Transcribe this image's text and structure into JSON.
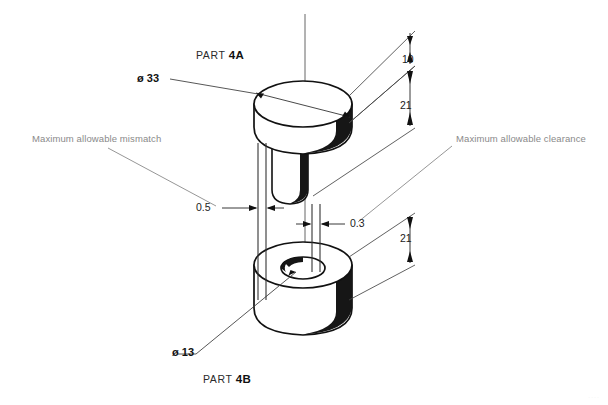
{
  "drawing": {
    "title_parts": [
      {
        "prefix": "PART",
        "id": "4A"
      },
      {
        "prefix": "PART",
        "id": "4B"
      }
    ],
    "part_top_label_prefix": "PART",
    "part_top_label_id": "4A",
    "part_bottom_label_prefix": "PART",
    "part_bottom_label_id": "4B",
    "diameters": {
      "head": "ø 33",
      "bore": "ø 13"
    },
    "dimensions": {
      "top_flange_height": "10",
      "top_part_height": "21",
      "bottom_part_height": "21"
    },
    "tolerances": {
      "mismatch_value": "0.5",
      "clearance_value": "0.3"
    },
    "notes": {
      "left": "Maximum allowable mismatch",
      "right": "Maximum allowable clearance"
    },
    "colors": {
      "line": "#111111",
      "shade": "#161616",
      "thin_line": "#3a3a3a",
      "note_text": "#8a8a8a",
      "background": "#ffffff"
    },
    "corner_mark": "...."
  }
}
